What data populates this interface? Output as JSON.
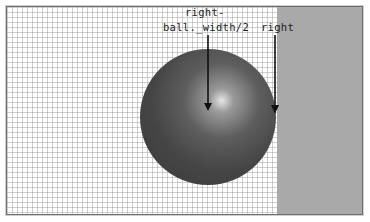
{
  "diagram": {
    "labels": {
      "center_line1": "right-",
      "center_line2": "ball._width/2",
      "right_edge": "right"
    },
    "colors": {
      "grid_line": "#969696",
      "wall": "#a9a9a9",
      "ball_dark": "#3a3a3a",
      "ball_highlight": "#e6e6e6",
      "arrow": "#111111"
    },
    "shapes": {
      "ball": {
        "cx": 207,
        "cy": 116,
        "r": 68
      },
      "wall_x": 276,
      "arrows": [
        {
          "name": "center-arrow",
          "x": 208,
          "y1": 35,
          "y2": 111
        },
        {
          "name": "right-arrow",
          "x": 275,
          "y1": 35,
          "y2": 114
        }
      ]
    }
  }
}
